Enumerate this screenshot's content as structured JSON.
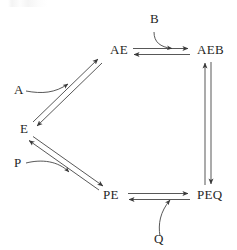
{
  "diagram": {
    "type": "enzyme-kinetics-cycle",
    "title": "",
    "stroke_color": "#3a3a3a",
    "text_color": "#262626",
    "background_color": "#ffffff",
    "nodes": [
      {
        "id": "AE",
        "label": "AE",
        "x": 110,
        "y": 54
      },
      {
        "id": "AEB",
        "label": "AEB",
        "x": 197,
        "y": 54
      },
      {
        "id": "E",
        "label": "E",
        "x": 20,
        "y": 133
      },
      {
        "id": "PE",
        "label": "PE",
        "x": 103,
        "y": 199
      },
      {
        "id": "PEQ",
        "label": "PEQ",
        "x": 197,
        "y": 199
      }
    ],
    "substrates": [
      {
        "id": "A",
        "label": "A",
        "x": 14,
        "y": 94,
        "role": "substrate-in"
      },
      {
        "id": "B",
        "label": "B",
        "x": 150,
        "y": 23,
        "role": "substrate-in"
      },
      {
        "id": "P",
        "label": "P",
        "x": 14,
        "y": 167,
        "role": "product-out"
      },
      {
        "id": "Q",
        "label": "Q",
        "x": 154,
        "y": 243,
        "role": "product-out"
      }
    ],
    "edges": [
      {
        "id": "ae-aeb",
        "from": "AE",
        "to": "AEB",
        "kind": "double-reversible",
        "orientation": "horizontal-top"
      },
      {
        "id": "aeb-peq",
        "from": "AEB",
        "to": "PEQ",
        "kind": "double-reversible",
        "orientation": "vertical-right"
      },
      {
        "id": "peq-pe",
        "from": "PEQ",
        "to": "PE",
        "kind": "double-reversible",
        "orientation": "horizontal-bottom"
      },
      {
        "id": "pe-e",
        "from": "PE",
        "to": "E",
        "kind": "double-reversible",
        "orientation": "diagonal-lower-left"
      },
      {
        "id": "e-ae",
        "from": "E",
        "to": "AE",
        "kind": "double-reversible",
        "orientation": "diagonal-upper-left"
      }
    ],
    "curved_connectors": [
      {
        "id": "a-into-e-ae",
        "substrate": "A",
        "target_edge": "e-ae"
      },
      {
        "id": "b-into-ae-aeb",
        "substrate": "B",
        "target_edge": "ae-aeb"
      },
      {
        "id": "p-off-pe-e",
        "substrate": "P",
        "target_edge": "pe-e"
      },
      {
        "id": "q-off-peq-pe",
        "substrate": "Q",
        "target_edge": "peq-pe"
      }
    ]
  }
}
